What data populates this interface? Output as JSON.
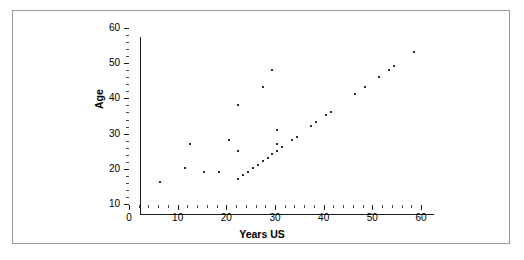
{
  "chart_data": {
    "type": "scatter",
    "title": "",
    "xlabel": "Years US",
    "ylabel": "Age",
    "xlim": [
      0,
      60
    ],
    "ylim": [
      10,
      60
    ],
    "xticks": [
      0,
      10,
      20,
      30,
      40,
      50,
      60
    ],
    "yticks": [
      10,
      20,
      30,
      40,
      50,
      60
    ],
    "x_minor_tick_step": 2,
    "y_minor_tick_step": 2,
    "grid": false,
    "legend": null,
    "marker": "dot",
    "marker_color": "#2b2b3a",
    "points": [
      {
        "x": 4,
        "y": 19
      },
      {
        "x": 9,
        "y": 23
      },
      {
        "x": 10,
        "y": 30
      },
      {
        "x": 13,
        "y": 22
      },
      {
        "x": 16,
        "y": 22
      },
      {
        "x": 18,
        "y": 31
      },
      {
        "x": 20,
        "y": 20
      },
      {
        "x": 20,
        "y": 28
      },
      {
        "x": 20,
        "y": 41
      },
      {
        "x": 21,
        "y": 21
      },
      {
        "x": 22,
        "y": 22
      },
      {
        "x": 23,
        "y": 23
      },
      {
        "x": 24,
        "y": 24
      },
      {
        "x": 25,
        "y": 25
      },
      {
        "x": 25,
        "y": 46
      },
      {
        "x": 26,
        "y": 26
      },
      {
        "x": 27,
        "y": 27
      },
      {
        "x": 27,
        "y": 51
      },
      {
        "x": 28,
        "y": 28
      },
      {
        "x": 28,
        "y": 30
      },
      {
        "x": 28,
        "y": 34
      },
      {
        "x": 29,
        "y": 29
      },
      {
        "x": 31,
        "y": 31
      },
      {
        "x": 32,
        "y": 32
      },
      {
        "x": 35,
        "y": 35
      },
      {
        "x": 36,
        "y": 36
      },
      {
        "x": 38,
        "y": 38
      },
      {
        "x": 39,
        "y": 39
      },
      {
        "x": 44,
        "y": 44
      },
      {
        "x": 46,
        "y": 46
      },
      {
        "x": 49,
        "y": 49
      },
      {
        "x": 51,
        "y": 51
      },
      {
        "x": 52,
        "y": 52
      },
      {
        "x": 56,
        "y": 56
      }
    ]
  },
  "axes": {
    "x_tick_labels": [
      "0",
      "10",
      "20",
      "30",
      "40",
      "50",
      "60"
    ],
    "y_tick_labels": [
      "10",
      "20",
      "30",
      "40",
      "50",
      "60"
    ],
    "x_axis_title": "Years US",
    "y_axis_title": "Age"
  },
  "style": {
    "frame_color": "#9a9a9a",
    "axis_color": "#1a1a1a",
    "background": "#ffffff"
  }
}
